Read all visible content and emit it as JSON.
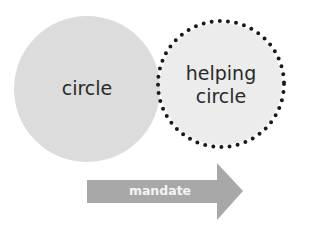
{
  "diagram": {
    "nodes": [
      {
        "id": "circle",
        "label": "circle",
        "style": "filled",
        "fill": "#dcdcdc"
      },
      {
        "id": "helping-circle",
        "label_lines": [
          "helping",
          "circle"
        ],
        "style": "dotted-border",
        "fill": "#ececec",
        "border": "#1a1a1a"
      }
    ],
    "arrow": {
      "label": "mandate",
      "fill": "#a8a8a8",
      "direction": "right"
    }
  }
}
